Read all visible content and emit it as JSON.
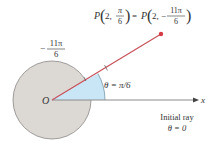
{
  "title_label": {
    "lhs_letter": "P",
    "lhs_r": "2,",
    "lhs_num": "π",
    "lhs_den": "6",
    "equals": "=",
    "rhs_letter": "P",
    "rhs_r": "2,",
    "rhs_sign": "−",
    "rhs_num": "11π",
    "rhs_den": "6"
  },
  "neg_angle_label": {
    "sign": "−",
    "num": "11π",
    "den": "6"
  },
  "origin_label": "O",
  "angle_label": "θ = π/6",
  "axis_label": "x",
  "initial_ray": {
    "line1": "Initial ray",
    "line2": "θ = 0"
  },
  "colors": {
    "circle_fill": "#dcd9d5",
    "circle_stroke": "#8a8784",
    "sector_fill": "#c8e6f5",
    "ray_color": "#c8505a",
    "point_color": "#d63a45",
    "axis_color": "#8c8c8c",
    "text_color": "#333333"
  }
}
